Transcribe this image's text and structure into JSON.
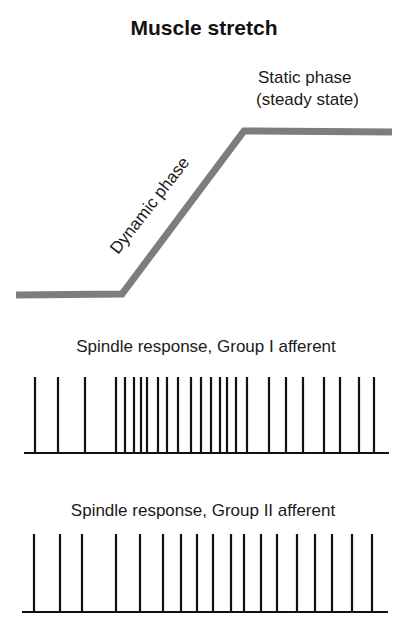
{
  "title": "Muscle stretch",
  "stretch_panel": {
    "static_label_line1": "Static phase",
    "static_label_line2": "(steady state)",
    "dynamic_label": "Dynamic phase",
    "line_color": "#7d7d7d",
    "points": [
      [
        16,
        295
      ],
      [
        122,
        294
      ],
      [
        244,
        131
      ],
      [
        392,
        132
      ]
    ]
  },
  "group1": {
    "label": "Spindle response, Group I afferent",
    "baseline": {
      "x1": 24,
      "x2": 389,
      "y": 453
    },
    "spike_top": 377,
    "spikes_x": [
      35,
      58,
      85,
      116,
      125,
      134,
      141,
      147,
      158,
      167,
      178,
      191,
      201,
      211,
      220,
      227,
      236,
      247,
      269,
      286,
      303,
      324,
      340,
      359,
      374
    ]
  },
  "group2": {
    "label": "Spindle response, Group II afferent",
    "baseline": {
      "x1": 22,
      "x2": 388,
      "y": 612
    },
    "spike_top": 534,
    "spikes_x": [
      34,
      60,
      82,
      116,
      140,
      163,
      181,
      197,
      213,
      231,
      244,
      261,
      277,
      297,
      315,
      332,
      352,
      372
    ]
  },
  "chart_data": {
    "type": "line",
    "title": "Muscle stretch",
    "annotations": [
      "Dynamic phase",
      "Static phase (steady state)"
    ],
    "series": [
      {
        "name": "Muscle stretch",
        "description": "flat, linear ramp (dynamic phase), then flat plateau (static phase)"
      },
      {
        "name": "Spindle response, Group I afferent",
        "spike_count": 25,
        "description": "low rate before stretch, high burst during dynamic phase, moderate steady rate during static phase"
      },
      {
        "name": "Spindle response, Group II afferent",
        "spike_count": 18,
        "description": "low rate before stretch, gradual increase through dynamic phase, sustained steady rate during static phase"
      }
    ]
  }
}
